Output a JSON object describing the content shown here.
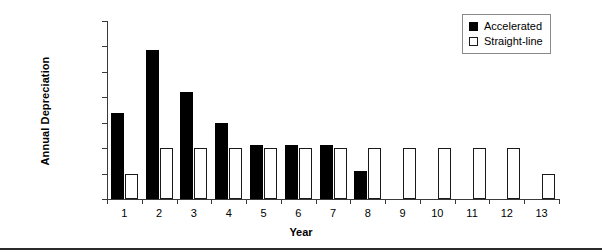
{
  "chart_data": {
    "type": "bar",
    "title": "",
    "xlabel": "Year",
    "ylabel": "Annual Depreciation",
    "categories": [
      "1",
      "2",
      "3",
      "4",
      "5",
      "6",
      "7",
      "8",
      "9",
      "10",
      "11",
      "12",
      "13"
    ],
    "series": [
      {
        "name": "Accelerated",
        "color": "#000000",
        "values": [
          17000,
          29300,
          21000,
          15000,
          10700,
          10700,
          10700,
          5600,
          0,
          0,
          0,
          0,
          0
        ]
      },
      {
        "name": "Straight-line",
        "color": "#ffffff",
        "values": [
          5000,
          10000,
          10000,
          10000,
          10000,
          10000,
          10000,
          10000,
          10000,
          10000,
          10000,
          10000,
          5000
        ]
      }
    ],
    "ylim": [
      0,
      35000
    ],
    "ytick_values": [
      0,
      5000,
      10000,
      15000,
      20000,
      25000,
      30000,
      35000
    ],
    "ytick_labels": [
      "$0",
      "$5,000",
      "$10,000",
      "$15,000",
      "$20,000",
      "$25,000",
      "$30,000",
      "$35,000"
    ],
    "grid": false,
    "legend_position": "top-right"
  },
  "legend": {
    "entries": [
      {
        "label": "Accelerated",
        "swatch": "filled-square-icon"
      },
      {
        "label": "Straight-line",
        "swatch": "outlined-square-icon"
      }
    ]
  }
}
